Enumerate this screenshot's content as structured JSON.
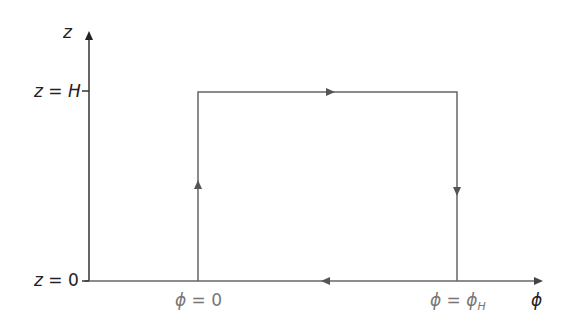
{
  "diagram": {
    "type": "integration-contour",
    "axes": {
      "vertical": {
        "label": "z"
      },
      "horizontal": {
        "label": "ϕ"
      }
    },
    "ticks": {
      "z_top": {
        "var": "z",
        "eq": " = ",
        "val": "H"
      },
      "z_bottom": {
        "var": "z",
        "eq": " = ",
        "val": "0"
      },
      "phi_left": {
        "var": "ϕ",
        "eq": " = ",
        "val": "0"
      },
      "phi_right": {
        "var": "ϕ",
        "eq": " = ",
        "val": "ϕ",
        "sub": "H"
      }
    },
    "contour": {
      "corners": [
        "(ϕ=0, z=0)",
        "(ϕ=0, z=H)",
        "(ϕ=ϕ_H, z=H)",
        "(ϕ=ϕ_H, z=0)"
      ],
      "direction": [
        "up along ϕ=0",
        "right along z=H",
        "down along ϕ=ϕ_H",
        "left along z=0"
      ]
    },
    "colors": {
      "axis": "#222222",
      "contour": "#666666",
      "label": "#777777"
    }
  }
}
